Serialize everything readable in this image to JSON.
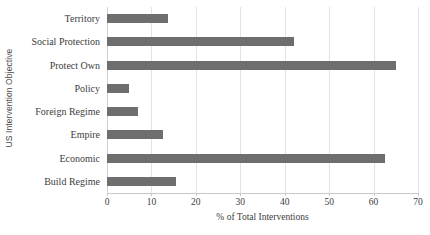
{
  "chart_data": {
    "type": "bar",
    "orientation": "horizontal",
    "title": "",
    "xlabel": "% of Total Interventions",
    "ylabel": "US Intervention Objective",
    "categories": [
      "Territory",
      "Social Protection",
      "Protect Own",
      "Policy",
      "Foreign Regime",
      "Empire",
      "Economic",
      "Build Regime"
    ],
    "values": [
      13.7,
      42.0,
      65.0,
      5.0,
      7.0,
      12.5,
      62.5,
      15.5
    ],
    "xlim": [
      0,
      70
    ],
    "xticks": [
      0,
      10,
      20,
      30,
      40,
      50,
      60,
      70
    ],
    "xtick_labels": [
      "0",
      "10",
      "20",
      "30",
      "40",
      "50",
      "60",
      "70"
    ],
    "grid": "vertical",
    "legend": "none",
    "bar_color": "#6e6e6e",
    "gridline_color": "#e3e3e3",
    "background_color": "#ffffff"
  }
}
